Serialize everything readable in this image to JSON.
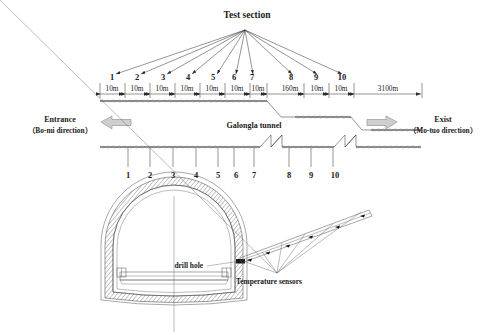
{
  "figure": {
    "title": "Test section",
    "tunnel_label": "Galongla tunnel",
    "entrance": {
      "line1": "Entrance",
      "line2": "（Bo-mi direction）"
    },
    "exit": {
      "line1": "Exist",
      "line2": "（Mo-tuo direction）"
    },
    "drill_hole_label": "drill hole",
    "sensors_label": "Temperature sensors"
  },
  "sections": {
    "numbers": [
      "1",
      "2",
      "3",
      "4",
      "5",
      "6",
      "7",
      "8",
      "9",
      "10"
    ],
    "spacings": [
      "10m",
      "10m",
      "10m",
      "10m",
      "10m",
      "10m",
      "10m",
      "160m",
      "10m",
      "10m",
      "3100m"
    ]
  },
  "colors": {
    "ink": "#1a1a1a",
    "line": "#2b2b2b",
    "ground": "#6a6a6a",
    "arrow_fill": "#cfcfcf",
    "arrow_stroke": "#8a8a8a",
    "background": "#ffffff"
  }
}
